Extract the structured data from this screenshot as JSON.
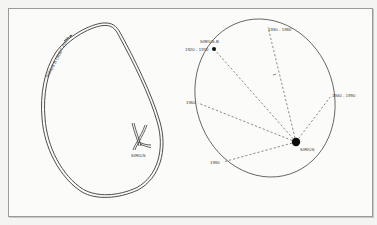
{
  "figure": {
    "left_panel": {
      "orbit_label": "SIRIUS B ORBIT PATH",
      "star_label": "SIRIUS"
    },
    "right_panel": {
      "companion_label": "SIRIUS-B",
      "star_label": "SIRIUS",
      "positions": [
        {
          "label": "1920 - 1970",
          "x": 214,
          "y": 49
        },
        {
          "label": "1930 - 1980",
          "x": 268,
          "y": 23
        },
        {
          "label": "1940 - 1990",
          "x": 331,
          "y": 96
        },
        {
          "label": "1960",
          "x": 198,
          "y": 102
        },
        {
          "label": "1990",
          "x": 223,
          "y": 162
        }
      ]
    },
    "colors": {
      "line": "#3a3a3a",
      "background": "#fbfbfa",
      "frame": "#9a9a9a"
    }
  }
}
